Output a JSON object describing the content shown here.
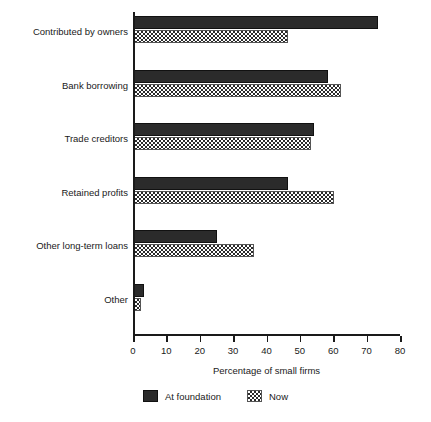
{
  "chart_data": {
    "type": "bar",
    "orientation": "horizontal",
    "title": "",
    "xlabel": "Percentage of small firms",
    "ylabel": "",
    "xlim": [
      0,
      80
    ],
    "xticks": [
      0,
      10,
      20,
      30,
      40,
      50,
      60,
      70,
      80
    ],
    "grid": false,
    "legend_position": "bottom",
    "categories": [
      "Contributed by owners",
      "Bank borrowing",
      "Trade creditors",
      "Retained profits",
      "Other long-term loans",
      "Other"
    ],
    "series": [
      {
        "name": "At foundation",
        "style": "solid-black",
        "color": "#2b2b2b",
        "values": [
          73,
          58,
          54,
          46,
          25,
          3
        ]
      },
      {
        "name": "Now",
        "style": "checkered",
        "color": "#ffffff",
        "values": [
          46,
          62,
          53,
          60,
          36,
          2
        ]
      }
    ]
  },
  "axis": {
    "x_title": "Percentage of small firms",
    "tick_labels": [
      "0",
      "10",
      "20",
      "30",
      "40",
      "50",
      "60",
      "70",
      "80"
    ]
  },
  "legend": {
    "items": [
      {
        "label": "At foundation",
        "swatch": "solid-black-swatch"
      },
      {
        "label": "Now",
        "swatch": "checkered-swatch"
      }
    ]
  }
}
